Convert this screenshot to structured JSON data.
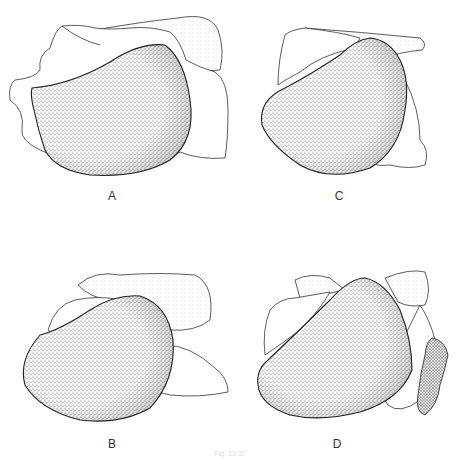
{
  "figure": {
    "panels": [
      {
        "id": "A",
        "label": "A"
      },
      {
        "id": "B",
        "label": "B"
      },
      {
        "id": "C",
        "label": "C"
      },
      {
        "id": "D",
        "label": "D"
      }
    ],
    "caption": "Fig. 33-37",
    "colors": {
      "outline": "#222222",
      "stipple": "#555555",
      "light_stipple": "#aaaaaa",
      "background": "#ffffff"
    }
  }
}
